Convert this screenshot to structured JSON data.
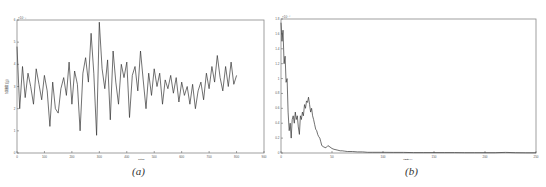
{
  "figure": {
    "caption_a": "(a)",
    "caption_b": "(b)"
  },
  "chart_data": [
    {
      "id": "a",
      "type": "line",
      "title": "",
      "xlabel": "时间",
      "ylabel": "加速度 (g)",
      "y_exponent": "×10⁻³",
      "xlim": [
        0,
        900
      ],
      "ylim": [
        0,
        6
      ],
      "xticks": [
        0,
        100,
        200,
        300,
        400,
        500,
        600,
        700,
        800,
        900
      ],
      "yticks": [
        0,
        1,
        2,
        3,
        4,
        5,
        6
      ],
      "grid": false,
      "x": [
        0,
        10,
        20,
        30,
        40,
        50,
        60,
        70,
        80,
        90,
        100,
        110,
        120,
        130,
        140,
        150,
        160,
        170,
        180,
        190,
        200,
        210,
        220,
        230,
        240,
        250,
        260,
        270,
        280,
        290,
        300,
        310,
        320,
        330,
        340,
        350,
        360,
        370,
        380,
        390,
        400,
        410,
        420,
        430,
        440,
        450,
        460,
        470,
        480,
        490,
        500,
        510,
        520,
        530,
        540,
        550,
        560,
        570,
        580,
        590,
        600,
        610,
        620,
        630,
        640,
        650,
        660,
        670,
        680,
        690,
        700,
        710,
        720,
        730,
        740,
        750,
        760,
        770,
        780,
        790,
        800
      ],
      "values": [
        4.8,
        2.0,
        3.9,
        2.5,
        3.6,
        3.0,
        2.2,
        3.8,
        3.1,
        2.4,
        3.5,
        2.8,
        1.2,
        3.2,
        2.0,
        1.8,
        2.9,
        3.4,
        2.6,
        4.1,
        2.2,
        3.7,
        3.1,
        1.0,
        3.6,
        4.3,
        3.2,
        5.4,
        3.6,
        0.8,
        5.9,
        3.8,
        2.9,
        4.2,
        1.5,
        4.6,
        3.2,
        2.2,
        4.0,
        3.4,
        4.1,
        1.6,
        3.5,
        3.9,
        2.8,
        4.6,
        3.3,
        2.0,
        3.6,
        2.6,
        3.8,
        3.0,
        3.6,
        2.2,
        3.3,
        2.9,
        3.5,
        2.7,
        3.4,
        2.3,
        3.2,
        2.6,
        3.0,
        2.2,
        3.1,
        2.0,
        2.8,
        3.2,
        2.4,
        3.6,
        2.9,
        3.9,
        3.2,
        4.4,
        3.4,
        2.8,
        3.9,
        3.0,
        4.1,
        3.1,
        3.5
      ]
    },
    {
      "id": "b",
      "type": "line",
      "title": "",
      "xlabel": "频率 Hz",
      "ylabel": "",
      "y_exponent": "×10⁻⁴",
      "xlim": [
        0,
        250
      ],
      "ylim": [
        0,
        1.8
      ],
      "xticks": [
        0,
        50,
        100,
        150,
        200,
        250
      ],
      "yticks": [
        0,
        0.2,
        0.4,
        0.6,
        0.8,
        1.0,
        1.2,
        1.4,
        1.6,
        1.8
      ],
      "grid": false,
      "x": [
        0,
        1,
        2,
        3,
        4,
        5,
        6,
        7,
        8,
        9,
        10,
        11,
        12,
        13,
        14,
        15,
        16,
        17,
        18,
        19,
        20,
        21,
        22,
        23,
        24,
        25,
        26,
        27,
        28,
        29,
        30,
        31,
        32,
        33,
        34,
        35,
        36,
        37,
        38,
        39,
        40,
        42,
        44,
        46,
        48,
        50,
        52,
        55,
        58,
        60,
        62,
        65,
        70,
        75,
        80,
        85,
        90,
        100,
        110,
        120,
        130,
        140,
        150,
        160,
        170,
        180,
        190,
        200,
        210,
        220,
        230,
        240,
        250
      ],
      "values": [
        1.75,
        1.5,
        1.65,
        1.2,
        1.3,
        0.95,
        1.0,
        0.55,
        0.3,
        0.4,
        0.2,
        0.45,
        0.5,
        0.4,
        0.55,
        0.45,
        0.5,
        0.35,
        0.25,
        0.5,
        0.45,
        0.55,
        0.5,
        0.65,
        0.6,
        0.7,
        0.68,
        0.75,
        0.65,
        0.55,
        0.6,
        0.5,
        0.45,
        0.38,
        0.32,
        0.3,
        0.25,
        0.22,
        0.2,
        0.15,
        0.1,
        0.08,
        0.07,
        0.1,
        0.08,
        0.06,
        0.05,
        0.04,
        0.03,
        0.03,
        0.025,
        0.02,
        0.02,
        0.015,
        0.015,
        0.01,
        0.01,
        0.01,
        0.008,
        0.008,
        0.006,
        0.006,
        0.005,
        0.005,
        0.005,
        0.004,
        0.004,
        0.004,
        0.004,
        0.008,
        0.004,
        0.003,
        0.003
      ]
    }
  ]
}
